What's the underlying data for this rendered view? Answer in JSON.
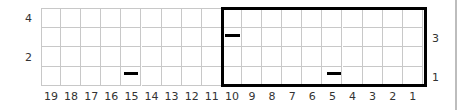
{
  "chart_data": {
    "type": "table",
    "title": "",
    "columns": [
      19,
      18,
      17,
      16,
      15,
      14,
      13,
      12,
      11,
      10,
      9,
      8,
      7,
      6,
      5,
      4,
      3,
      2,
      1
    ],
    "rows": 4,
    "left_row_labels": [
      {
        "row": 4,
        "label": "4"
      },
      {
        "row": 2,
        "label": "2"
      }
    ],
    "right_row_labels": [
      {
        "row": 3,
        "label": "3"
      },
      {
        "row": 1,
        "label": "1"
      }
    ],
    "highlight_box": {
      "from_column": 10,
      "to_column": 1,
      "from_row": 1,
      "to_row": 4
    },
    "symbols": [
      {
        "column": 15,
        "row": 1,
        "symbol": "dash"
      },
      {
        "column": 10,
        "row": 3,
        "symbol": "dash"
      },
      {
        "column": 5,
        "row": 1,
        "symbol": "dash"
      }
    ],
    "grid": true
  },
  "labels": {
    "columns": [
      "19",
      "18",
      "17",
      "16",
      "15",
      "14",
      "13",
      "12",
      "11",
      "10",
      "9",
      "8",
      "7",
      "6",
      "5",
      "4",
      "3",
      "2",
      "1"
    ],
    "left_rows": [
      "4",
      "2"
    ],
    "right_rows": [
      "3",
      "1"
    ]
  },
  "colors": {
    "grid": "#c8c8c8",
    "box": "#000000",
    "symbol": "#000000"
  }
}
